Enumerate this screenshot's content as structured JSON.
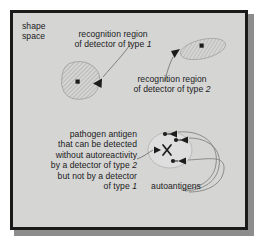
{
  "figure": {
    "background_color": "#d5d5d4",
    "border_color": "#1a1a1a",
    "ink_color": "#1b1b1b",
    "width": 260,
    "height": 242
  },
  "labels": {
    "shape_space": "shape\nspace",
    "region_type1_line1": "recognition region",
    "region_type1_line2": "of detector of type ",
    "region_type1_italic": "1",
    "region_type2_line1": "recognition region",
    "region_type2_line2": "of detector of type ",
    "region_type2_italic": "2",
    "pathogen_line1": "pathogen antigen",
    "pathogen_line2": "that can be detected",
    "pathogen_line3": "without autoreactivity",
    "pathogen_line4a": "by a detector of type ",
    "pathogen_line4_italic": "2",
    "pathogen_line5": "but not by a detector",
    "pathogen_line6a": "of type ",
    "pathogen_line6_italic": "1",
    "autoantigens": "autoantigens"
  },
  "markers": {
    "antigen_glyph": "square",
    "detector_glyph": "triangle",
    "pathogen_glyph": "X",
    "autoantigen_glyph": "dot"
  },
  "shapes": {
    "recognition_region_type1": {
      "shape": "rounded-blob",
      "cx": 68,
      "cy": 68,
      "rx": 19,
      "ry": 17,
      "hatch": true
    },
    "recognition_region_type2": {
      "shape": "flattened-ellipse",
      "cx": 190,
      "cy": 38,
      "rx": 22,
      "ry": 10,
      "rotation": -12,
      "hatch": true
    },
    "recognition_region_autoreactive": {
      "shape": "ellipse",
      "cx": 158,
      "cy": 138,
      "rx": 22,
      "ry": 18,
      "hatch": false
    }
  }
}
